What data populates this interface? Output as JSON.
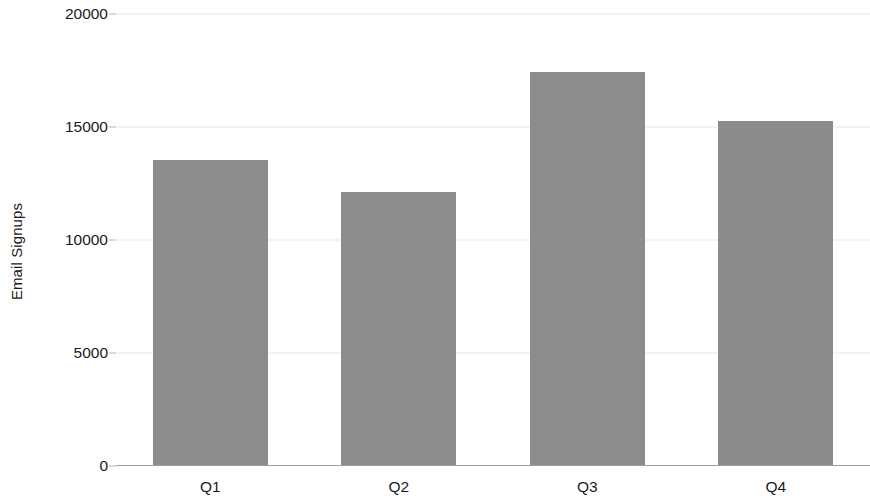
{
  "chart_data": {
    "type": "bar",
    "title": "",
    "subtitle": "",
    "xlabel": "",
    "ylabel": "Email Signups",
    "categories": [
      "Q1",
      "Q2",
      "Q3",
      "Q4"
    ],
    "values": [
      13500,
      12100,
      17400,
      15200
    ],
    "ylim": [
      0,
      20000
    ],
    "yticks": [
      0,
      5000,
      10000,
      15000,
      20000
    ],
    "ytick_labels": [
      "0",
      "5000",
      "10000",
      "15000",
      "20000"
    ],
    "grid": "horizontal",
    "legend": "none",
    "bar_color": "#8b8b8b",
    "grid_color": "#e8e8e8",
    "axis_color": "#9e9e9e",
    "text_color": "#1a1a1a",
    "annotations": []
  }
}
